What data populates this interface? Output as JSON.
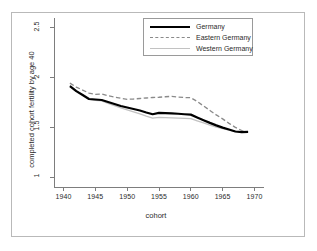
{
  "chart_data": {
    "type": "line",
    "title": "",
    "subtitle": "",
    "xlabel": "cohort",
    "ylabel": "completed cohort fertility by age 40",
    "xlim": [
      1938.5,
      1971.5
    ],
    "ylim": [
      0.9,
      2.62
    ],
    "xticks": [
      1940,
      1945,
      1950,
      1955,
      1960,
      1965,
      1970
    ],
    "xtick_labels": [
      "1940",
      "1945",
      "1950",
      "1955",
      "1960",
      "1965",
      "1970"
    ],
    "yticks": [
      1,
      1.5,
      2,
      2.5
    ],
    "ytick_labels": [
      "1",
      "1.5",
      "2",
      "2.5"
    ],
    "grid": false,
    "legend_position": "top-right",
    "x": [
      1941,
      1942,
      1943,
      1944,
      1945,
      1946,
      1947,
      1948,
      1949,
      1950,
      1951,
      1952,
      1953,
      1954,
      1955,
      1956,
      1957,
      1958,
      1959,
      1960,
      1961,
      1962,
      1963,
      1964,
      1965,
      1966,
      1967,
      1968,
      1969
    ],
    "series": [
      {
        "name": "Germany",
        "color": "#000000",
        "style": "solid",
        "width": 2.2,
        "values": [
          1.915,
          1.865,
          1.825,
          1.785,
          1.78,
          1.775,
          1.755,
          1.735,
          1.715,
          1.7,
          1.685,
          1.67,
          1.65,
          1.632,
          1.645,
          1.643,
          1.64,
          1.637,
          1.632,
          1.628,
          1.6,
          1.572,
          1.545,
          1.52,
          1.497,
          1.478,
          1.458,
          1.452,
          1.455
        ]
      },
      {
        "name": "Eastern Germany",
        "color": "#8a8a8a",
        "style": "dashed",
        "width": 1.3,
        "values": [
          1.945,
          1.905,
          1.875,
          1.845,
          1.832,
          1.835,
          1.818,
          1.805,
          1.793,
          1.782,
          1.785,
          1.79,
          1.795,
          1.8,
          1.803,
          1.808,
          1.812,
          1.805,
          1.8,
          1.798,
          1.76,
          1.715,
          1.67,
          1.625,
          1.585,
          1.54,
          1.5,
          1.468,
          1.452
        ]
      },
      {
        "name": "Western Germany",
        "color": "#c2c2c2",
        "style": "solid",
        "width": 1.3,
        "values": [
          1.92,
          1.868,
          1.825,
          1.782,
          1.772,
          1.766,
          1.742,
          1.718,
          1.695,
          1.675,
          1.655,
          1.635,
          1.612,
          1.592,
          1.6,
          1.598,
          1.596,
          1.593,
          1.59,
          1.588,
          1.566,
          1.545,
          1.523,
          1.503,
          1.487,
          1.472,
          1.458,
          1.452,
          1.455
        ]
      }
    ]
  },
  "legend": {
    "items": [
      {
        "label": "Germany"
      },
      {
        "label": "Eastern Germany"
      },
      {
        "label": "Western Germany"
      }
    ]
  }
}
